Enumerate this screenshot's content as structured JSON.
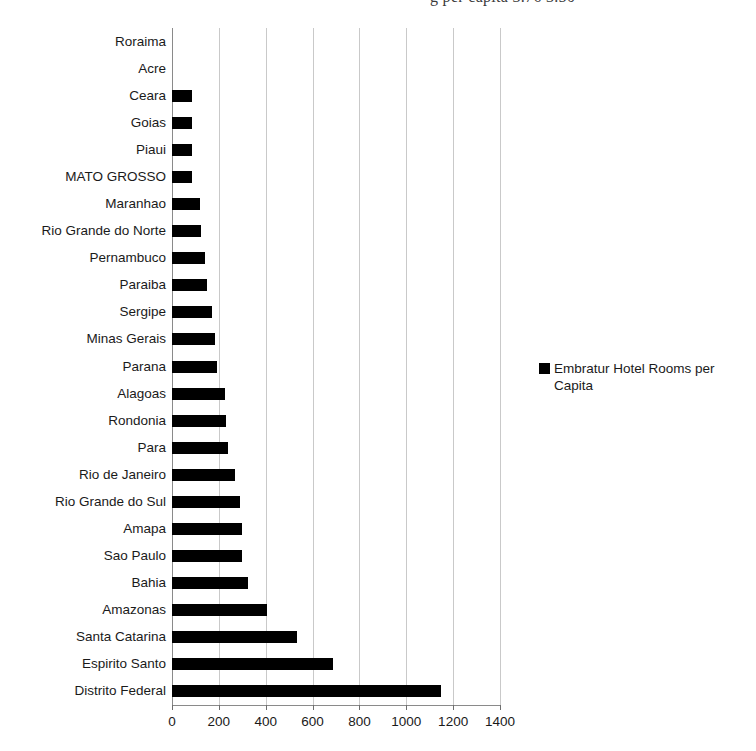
{
  "caption_sliver": {
    "text": "g per capita 3.76  3.50"
  },
  "legend": {
    "position": "right",
    "swatch_color": "#000000",
    "entries": [
      {
        "label": "Embratur Hotel Rooms per Capita"
      }
    ]
  },
  "chart_data": {
    "type": "bar",
    "orientation": "horizontal",
    "title": "",
    "xlabel": "",
    "ylabel": "",
    "xlim": [
      0,
      1400
    ],
    "xticks": [
      0,
      200,
      400,
      600,
      800,
      1000,
      1200,
      1400
    ],
    "xtick_labels": [
      "0",
      "200",
      "400",
      "600",
      "800",
      "1000",
      "1200",
      "1400"
    ],
    "grid": true,
    "grid_axis": "x",
    "legend_position": "right",
    "bar_color": "#000000",
    "categories": [
      "Roraima",
      "Acre",
      "Ceara",
      "Goias",
      "Piaui",
      "MATO GROSSO",
      "Maranhao",
      "Rio Grande do Norte",
      "Pernambuco",
      "Paraiba",
      "Sergipe",
      "Minas Gerais",
      "Parana",
      "Alagoas",
      "Rondonia",
      "Para",
      "Rio de Janeiro",
      "Rio Grande do Sul",
      "Amapa",
      "Sao Paulo",
      "Bahia",
      "Amazonas",
      "Santa Catarina",
      "Espirito Santo",
      "Distrito Federal"
    ],
    "series": [
      {
        "name": "Embratur Hotel Rooms per Capita",
        "values": [
          0,
          0,
          85,
          85,
          85,
          85,
          120,
          125,
          140,
          150,
          170,
          185,
          190,
          225,
          230,
          240,
          270,
          290,
          300,
          300,
          325,
          405,
          533,
          687,
          1148
        ]
      }
    ]
  }
}
